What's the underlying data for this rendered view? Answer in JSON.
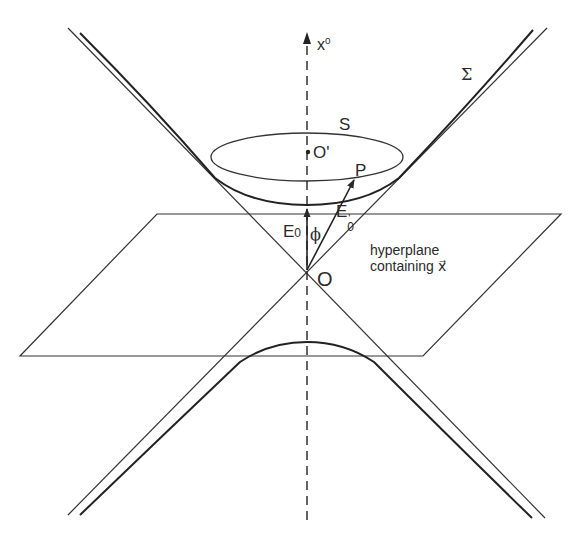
{
  "diagram": {
    "type": "spacetime light-cone diagram",
    "stroke_color": "#2a2a2a",
    "background": "#ffffff",
    "labels": {
      "axis": {
        "base": "x",
        "sup": "0"
      },
      "sigma": "Σ",
      "surface": "S",
      "origin_prime": "O'",
      "point": "P",
      "e0": {
        "base": "E",
        "sub": "0"
      },
      "e0_prime": {
        "base": "E",
        "sub": "0",
        "sup": "'"
      },
      "phi": "ϕ",
      "origin": "O",
      "hyperplane_line1": "hyperplane",
      "hyperplane_line2": "containing",
      "hyperplane_vector": "x⃗"
    },
    "elements": [
      "vertical dashed x0 axis with arrow",
      "light cone (two crossing lines through O)",
      "upper hyperboloid sheet Σ",
      "lower hyperboloid sheet",
      "ellipse S (slice of upper sheet) with center O'",
      "hyperplane parallelogram through O",
      "vector E0 from O along x0",
      "vector E0' from O to P",
      "angle phi between E0 and E0'"
    ]
  }
}
